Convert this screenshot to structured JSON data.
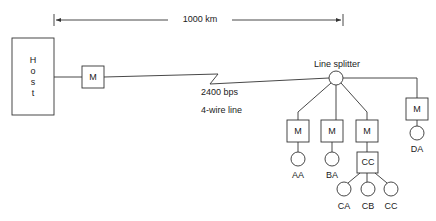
{
  "dimension": {
    "label": "1000 km"
  },
  "host": {
    "letters": [
      "H",
      "o",
      "s",
      "t"
    ]
  },
  "modem_label": "M",
  "link": {
    "speed": "2400 bps",
    "type": "4-wire line"
  },
  "splitter": {
    "label": "Line splitter"
  },
  "concentrator": {
    "label": "CC"
  },
  "terminals": {
    "aa": "AA",
    "ba": "BA",
    "ca": "CA",
    "cb": "CB",
    "cc": "CC",
    "da": "DA"
  },
  "colors": {
    "line": "#333333",
    "background": "#ffffff"
  }
}
